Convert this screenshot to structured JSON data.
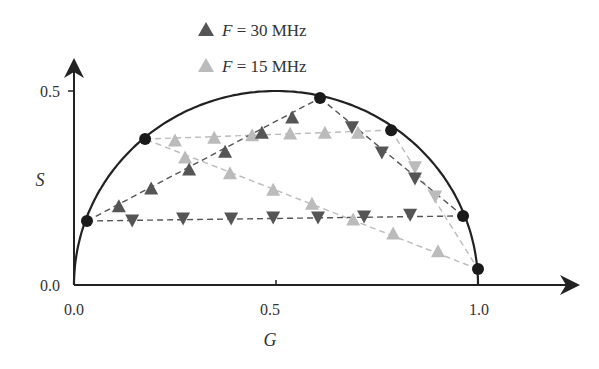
{
  "chart_data": {
    "type": "scatter",
    "title": "",
    "xlabel": "G",
    "ylabel": "S",
    "xlim": [
      0.0,
      1.25
    ],
    "ylim": [
      0.0,
      0.55
    ],
    "x_ticks": [
      {
        "value": 0.0,
        "label": "0.0"
      },
      {
        "value": 0.5,
        "label": "0.5"
      },
      {
        "value": 1.0,
        "label": "1.0"
      }
    ],
    "y_ticks": [
      {
        "value": 0.0,
        "label": "0.0"
      },
      {
        "value": 0.5,
        "label": "0.5"
      }
    ],
    "grid": false,
    "legend_position": "top-center",
    "universal_semicircle": {
      "center": [
        0.5,
        0.0
      ],
      "radius": 0.5,
      "color": "#222222"
    },
    "reference_points": {
      "color": "#1a1a1a",
      "points": [
        {
          "G": 0.032,
          "S": 0.165
        },
        {
          "G": 0.176,
          "S": 0.376
        },
        {
          "G": 0.609,
          "S": 0.482
        },
        {
          "G": 0.785,
          "S": 0.399
        },
        {
          "G": 0.963,
          "S": 0.178
        },
        {
          "G": 1.0,
          "S": 0.041
        }
      ]
    },
    "series": [
      {
        "name": "F = 30 MHz",
        "color": "#555555",
        "marker": "triangle",
        "segments": [
          {
            "from": [
              0.032,
              0.165
            ],
            "to": [
              0.609,
              0.482
            ],
            "marker_dir": "up",
            "points": [
              [
                0.111,
                0.204
              ],
              [
                0.191,
                0.25
              ],
              [
                0.285,
                0.299
              ],
              [
                0.374,
                0.345
              ],
              [
                0.465,
                0.394
              ],
              [
                0.54,
                0.433
              ]
            ]
          },
          {
            "from": [
              0.609,
              0.482
            ],
            "to": [
              0.963,
              0.178
            ],
            "marker_dir": "down",
            "points": [
              [
                0.688,
                0.405
              ],
              [
                0.762,
                0.34
              ],
              [
                0.844,
                0.273
              ]
            ]
          },
          {
            "from": [
              0.963,
              0.178
            ],
            "to": [
              0.032,
              0.165
            ],
            "marker_dir": "down",
            "points": [
              [
                0.144,
                0.165
              ],
              [
                0.27,
                0.17
              ],
              [
                0.389,
                0.17
              ],
              [
                0.493,
                0.173
              ],
              [
                0.604,
                0.173
              ],
              [
                0.718,
                0.175
              ],
              [
                0.832,
                0.18
              ]
            ]
          }
        ]
      },
      {
        "name": "F = 15 MHz",
        "color": "#bbbbbb",
        "marker": "triangle",
        "segments": [
          {
            "from": [
              0.176,
              0.376
            ],
            "to": [
              0.785,
              0.399
            ],
            "marker_dir": "up",
            "points": [
              [
                0.25,
                0.374
              ],
              [
                0.347,
                0.381
              ],
              [
                0.441,
                0.387
              ],
              [
                0.535,
                0.392
              ],
              [
                0.621,
                0.394
              ],
              [
                0.703,
                0.394
              ]
            ]
          },
          {
            "from": [
              0.785,
              0.399
            ],
            "to": [
              1.0,
              0.041
            ],
            "marker_dir": "down",
            "points": [
              [
                0.844,
                0.302
              ],
              [
                0.894,
                0.227
              ]
            ]
          },
          {
            "from": [
              1.0,
              0.041
            ],
            "to": [
              0.176,
              0.376
            ],
            "marker_dir": "up",
            "points": [
              [
                0.275,
                0.33
              ],
              [
                0.386,
                0.289
              ],
              [
                0.493,
                0.247
              ],
              [
                0.589,
                0.211
              ],
              [
                0.691,
                0.17
              ],
              [
                0.79,
                0.134
              ],
              [
                0.901,
                0.088
              ]
            ]
          }
        ]
      }
    ]
  },
  "legend": [
    {
      "symbol": "triangle-up",
      "color": "#555555",
      "var": "F",
      "rest": " = 30 MHz"
    },
    {
      "symbol": "triangle-up",
      "color": "#bbbbbb",
      "var": "F",
      "rest": " = 15 MHz"
    }
  ],
  "axes": {
    "x_label": "G",
    "y_label": "S"
  }
}
